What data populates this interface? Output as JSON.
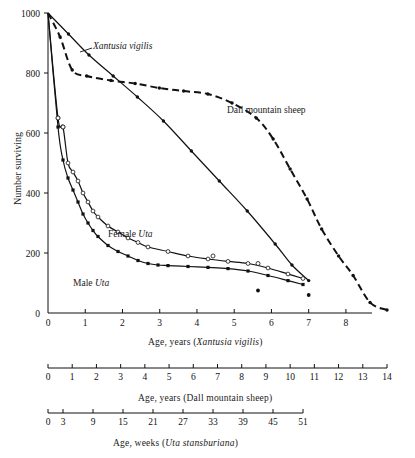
{
  "figure": {
    "title": "",
    "background": "#ffffff",
    "ink": "#111111"
  },
  "yaxis": {
    "title": "Number surviving",
    "ticks": [
      0,
      200,
      400,
      600,
      800,
      1000
    ],
    "min": 0,
    "max": 1000
  },
  "axes": [
    {
      "id": "xantusia-axis",
      "caption_plain": "Age, years (",
      "caption_italic": "Xantusia vigilis",
      "caption_close": ")",
      "ticks": [
        0,
        1,
        2,
        3,
        4,
        5,
        6,
        7,
        8
      ],
      "min": 0,
      "max": 8.7
    },
    {
      "id": "dall-sheep-axis",
      "caption_plain": "Age, years (Dall mountain sheep)",
      "caption_italic": "",
      "caption_close": "",
      "ticks": [
        0,
        1,
        2,
        3,
        4,
        5,
        6,
        7,
        8,
        9,
        10,
        11,
        12,
        13,
        14
      ],
      "min": 0,
      "max": 14
    },
    {
      "id": "uta-axis",
      "caption_plain": "Age, weeks (",
      "caption_italic": "Uta stansburiana",
      "caption_close": ")",
      "ticks": [
        0,
        3,
        9,
        15,
        21,
        27,
        33,
        39,
        45,
        51
      ],
      "min": 0,
      "max": 51
    }
  ],
  "curve_labels": {
    "xantusia": "Xantusia vigilis",
    "dall": "Dall mountain sheep",
    "female_uta": "Female Uta",
    "female_uta_plain": "Female ",
    "female_uta_italic": "Uta",
    "male_uta": "Male Uta",
    "male_uta_plain": "Male ",
    "male_uta_italic": "Uta"
  },
  "chart_data": {
    "type": "line",
    "title": "",
    "subtitle": "",
    "xlabel": "Age",
    "ylabel": "Number surviving",
    "ylim": [
      0,
      1000
    ],
    "grid": false,
    "legend": "inline-labels",
    "annotations": [
      "Xantusia vigilis",
      "Dall mountain sheep",
      "Female Uta",
      "Male Uta"
    ],
    "series": [
      {
        "name": "Xantusia vigilis",
        "axis": "xantusia-axis",
        "axis_units": "years",
        "style": "solid",
        "marker": "filled-circle",
        "x": [
          0,
          0.55,
          1.1,
          1.75,
          2.4,
          3.1,
          3.85,
          4.6,
          5.35,
          6.1,
          6.55,
          7.0
        ],
        "y": [
          1000,
          930,
          860,
          790,
          720,
          640,
          540,
          440,
          340,
          230,
          160,
          108
        ]
      },
      {
        "name": "Dall mountain sheep",
        "axis": "dall-sheep-axis",
        "axis_units": "years",
        "style": "dashed",
        "marker": "filled-circle",
        "x": [
          0,
          0.5,
          1.0,
          1.6,
          2.6,
          3.6,
          4.6,
          5.6,
          6.6,
          7.6,
          8.6,
          9.3,
          10.0,
          10.7,
          11.3,
          12.0,
          12.6,
          13.3,
          14.0
        ],
        "y": [
          1000,
          920,
          810,
          790,
          775,
          765,
          750,
          740,
          730,
          700,
          650,
          580,
          480,
          380,
          280,
          190,
          125,
          35,
          10
        ]
      },
      {
        "name": "Female Uta",
        "axis": "uta-axis",
        "axis_units": "weeks",
        "style": "solid",
        "marker": "open-circle",
        "x": [
          0,
          2,
          3,
          4,
          5,
          6,
          7,
          8,
          9,
          10,
          12,
          14,
          16,
          18,
          20,
          24,
          28,
          32,
          36,
          40,
          44,
          48,
          51
        ],
        "y": [
          1000,
          650,
          620,
          500,
          470,
          440,
          400,
          370,
          340,
          320,
          290,
          270,
          250,
          235,
          220,
          205,
          190,
          180,
          172,
          165,
          150,
          130,
          115
        ]
      },
      {
        "name": "Male Uta",
        "axis": "uta-axis",
        "axis_units": "weeks",
        "style": "solid",
        "marker": "filled-square",
        "x": [
          0,
          2,
          3,
          4,
          5,
          6,
          7,
          8,
          9,
          10,
          12,
          14,
          16,
          18,
          20,
          22,
          24,
          28,
          32,
          36,
          40,
          44,
          48,
          51
        ],
        "y": [
          1000,
          620,
          510,
          450,
          410,
          370,
          330,
          300,
          275,
          255,
          225,
          205,
          190,
          175,
          165,
          160,
          158,
          155,
          152,
          148,
          140,
          125,
          108,
          95
        ]
      }
    ],
    "scatter_points": [
      {
        "series": "Female Uta",
        "axis": "uta-axis",
        "x": 2.0,
        "y": 650,
        "marker": "open-circle"
      },
      {
        "series": "Female Uta",
        "axis": "uta-axis",
        "x": 3.0,
        "y": 620,
        "marker": "open-circle"
      },
      {
        "series": "Female Uta",
        "axis": "uta-axis",
        "x": 33.0,
        "y": 190,
        "marker": "open-circle"
      },
      {
        "series": "Female Uta",
        "axis": "uta-axis",
        "x": 42.0,
        "y": 165,
        "marker": "open-circle"
      },
      {
        "series": "Male Uta",
        "axis": "uta-axis",
        "x": 42.0,
        "y": 75,
        "marker": "filled-circle"
      },
      {
        "series": "Xantusia vigilis",
        "axis": "xantusia-axis",
        "x": 7.0,
        "y": 60,
        "marker": "filled-circle"
      }
    ]
  }
}
